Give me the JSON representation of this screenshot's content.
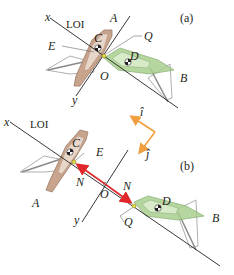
{
  "figure": {
    "panels": [
      {
        "id": "a",
        "label": "(a)",
        "axis_x_label": "x",
        "axis_y_label": "y",
        "line_of_impact_label": "LOI",
        "labels": {
          "A": "A",
          "B": "B",
          "C": "C",
          "D": "D",
          "E": "E",
          "O": "O",
          "Q": "Q"
        }
      },
      {
        "id": "b",
        "label": "(b)",
        "axis_x_label": "x",
        "axis_y_label": "y",
        "line_of_impact_label": "LOI",
        "labels": {
          "A": "A",
          "B": "B",
          "C": "C",
          "D": "D",
          "E": "E",
          "O": "O",
          "Q": "Q"
        },
        "force_labels": {
          "left": "N",
          "right": "N"
        }
      }
    ],
    "unit_vectors": {
      "i": "î",
      "j": "ĵ"
    },
    "colors": {
      "boat_a_hull": "#c9a48c",
      "boat_a_deck": "#e8d6c8",
      "boat_b_hull": "#a9cf8e",
      "boat_b_deck": "#d8ebc9",
      "force_arrow": "#e0282b",
      "unit_vector": "#f0a040",
      "contact_point": "#e8e040",
      "line": "#231f20"
    }
  }
}
